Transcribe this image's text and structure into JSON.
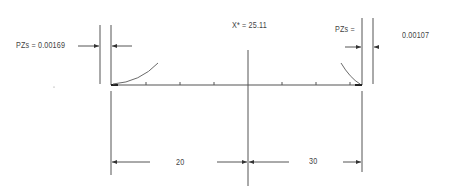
{
  "diagram": {
    "left_label": "PZs =  0.00169",
    "center_label": "X* = 25.11",
    "right_label_name": "PZs =",
    "right_label_value": "0.00107",
    "dim_left": "20",
    "dim_right": "30",
    "stroke_color": "#555555",
    "curve_color": "#6a6a6a"
  }
}
